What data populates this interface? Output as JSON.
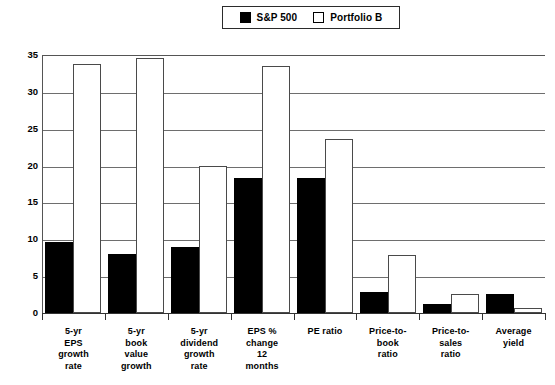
{
  "legend": {
    "entries": [
      {
        "label": "S&P 500",
        "style": "filled",
        "color": "#000000"
      },
      {
        "label": "Portfolio B",
        "style": "hollow",
        "color": "#ffffff"
      }
    ]
  },
  "axes": {
    "y_ticks": [
      "35",
      "30",
      "25",
      "20",
      "15",
      "10",
      "5",
      "0"
    ],
    "y_min": 0,
    "y_max": 35,
    "y_step": 5
  },
  "chart_data": {
    "type": "bar",
    "title": "",
    "subtitle": "",
    "xlabel": "",
    "ylabel": "",
    "ylim": [
      0,
      35
    ],
    "ytick_step": 5,
    "grid": true,
    "legend_position": "top-center",
    "categories": [
      "5-yr\nEPS\ngrowth\nrate",
      "5-yr\nbook\nvalue\ngrowth",
      "5-yr\ndividend\ngrowth\nrate",
      "EPS %\nchange\n12\nmonths",
      "PE  ratio",
      "Price-to-\nbook\nratio",
      "Price-to-\nsales\nratio",
      "Average\nyield"
    ],
    "series": [
      {
        "name": "S&P 500",
        "color": "#000000",
        "values": [
          9.6,
          8.0,
          8.9,
          18.3,
          18.3,
          2.9,
          1.2,
          2.6
        ]
      },
      {
        "name": "Portfolio B",
        "color": "#ffffff",
        "values": [
          33.8,
          34.6,
          19.9,
          33.5,
          23.6,
          7.9,
          2.6,
          0.7
        ]
      }
    ]
  }
}
